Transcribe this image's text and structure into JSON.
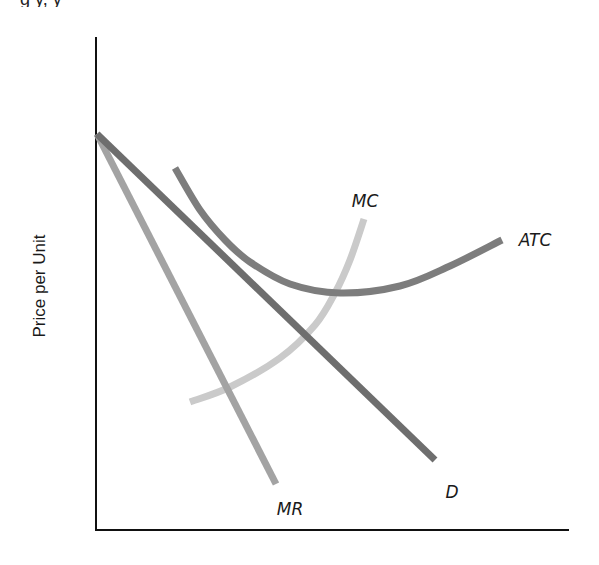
{
  "chart_data": {
    "type": "line",
    "title": "",
    "xlabel": "",
    "ylabel": "Price per Unit",
    "grid": false,
    "legend": "none (curves labeled directly)",
    "axes": {
      "origin_px": [
        96,
        530
      ],
      "y_axis_top_px": [
        96,
        37
      ],
      "x_axis_right_px": [
        569,
        530
      ],
      "color": "#111111"
    },
    "series": [
      {
        "name": "D",
        "label": "D",
        "kind": "straight line (demand)",
        "color": "#6e6e6e",
        "points_px": [
          [
            97,
            134
          ],
          [
            435,
            460
          ]
        ],
        "label_pos_px": [
          452,
          492
        ]
      },
      {
        "name": "MR",
        "label": "MR",
        "kind": "straight line (marginal revenue)",
        "color": "#a3a3a3",
        "points_px": [
          [
            97,
            134
          ],
          [
            276,
            484
          ]
        ],
        "label_pos_px": [
          290,
          509
        ]
      },
      {
        "name": "ATC",
        "label": "ATC",
        "kind": "U-shaped curve (average total cost)",
        "color": "#7d7d7d",
        "points_px": [
          [
            175,
            168
          ],
          [
            200,
            210
          ],
          [
            225,
            240
          ],
          [
            250,
            262
          ],
          [
            290,
            284
          ],
          [
            340,
            293
          ],
          [
            400,
            286
          ],
          [
            450,
            266
          ],
          [
            502,
            240
          ]
        ],
        "label_pos_px": [
          535,
          240
        ]
      },
      {
        "name": "MC",
        "label": "MC",
        "kind": "upward-sloping convex curve (marginal cost)",
        "color": "#cacaca",
        "points_px": [
          [
            190,
            402
          ],
          [
            230,
            387
          ],
          [
            280,
            358
          ],
          [
            315,
            325
          ],
          [
            335,
            293
          ],
          [
            350,
            260
          ],
          [
            364,
            219
          ]
        ],
        "label_pos_px": [
          365,
          201
        ]
      }
    ],
    "annotations": [
      {
        "text": "D",
        "near": "lower end of demand line"
      },
      {
        "text": "MR",
        "near": "lower end of marginal revenue line"
      },
      {
        "text": "ATC",
        "near": "right end of average total cost curve"
      },
      {
        "text": "MC",
        "near": "upper end of marginal cost curve"
      }
    ]
  },
  "figure": {
    "ylabel": "Price per Unit",
    "labels": {
      "d": "D",
      "mr": "MR",
      "atc": "ATC",
      "mc": "MC"
    },
    "clipped_top_text": "g        y,       y"
  }
}
